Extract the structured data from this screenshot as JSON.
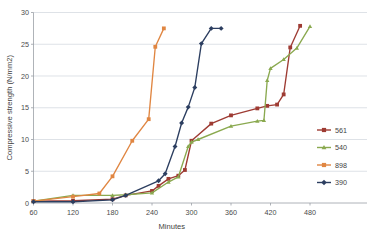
{
  "chart_data": {
    "type": "line",
    "title": "",
    "xlabel": "Minutes",
    "ylabel": "Compressive strength (N/mm2)",
    "xlim": [
      60,
      480
    ],
    "ylim": [
      0,
      30
    ],
    "xticks": [
      60,
      120,
      180,
      240,
      300,
      360,
      420,
      480
    ],
    "yticks": [
      0,
      5,
      10,
      15,
      20,
      25,
      30
    ],
    "grid": true,
    "legend_position": "right",
    "series": [
      {
        "name": "561",
        "color": "#9e3b33",
        "marker": "square",
        "x": [
          60,
          120,
          180,
          200,
          240,
          250,
          265,
          280,
          290,
          300,
          330,
          360,
          400,
          415,
          430,
          440,
          450,
          465
        ],
        "y": [
          0.3,
          0.35,
          0.6,
          1.2,
          1.9,
          2.7,
          3.8,
          4.3,
          5.2,
          9.8,
          12.5,
          13.8,
          14.9,
          15.3,
          15.5,
          17.1,
          24.5,
          27.9
        ]
      },
      {
        "name": "540",
        "color": "#8aa94f",
        "marker": "triangle",
        "x": [
          60,
          120,
          180,
          200,
          240,
          265,
          280,
          295,
          300,
          310,
          360,
          400,
          410,
          415,
          420,
          440,
          460,
          480
        ],
        "y": [
          0.3,
          1.2,
          1.2,
          1.3,
          1.6,
          3.3,
          4.1,
          8.9,
          9.6,
          10.0,
          12.1,
          12.9,
          13.0,
          19.3,
          21.2,
          22.6,
          24.4,
          27.8
        ]
      },
      {
        "name": "898",
        "color": "#e08642",
        "marker": "square",
        "x": [
          60,
          120,
          160,
          180,
          210,
          235,
          245,
          258
        ],
        "y": [
          0.3,
          1.0,
          1.5,
          4.2,
          9.8,
          13.2,
          24.6,
          27.5
        ]
      },
      {
        "name": "390",
        "color": "#2c3e60",
        "marker": "diamond",
        "x": [
          60,
          120,
          180,
          200,
          250,
          260,
          275,
          285,
          295,
          305,
          315,
          330,
          345
        ],
        "y": [
          0.2,
          0.2,
          0.5,
          1.2,
          3.5,
          4.6,
          8.9,
          12.6,
          15.1,
          18.2,
          25.1,
          27.5,
          27.5
        ]
      }
    ]
  },
  "legend": {
    "entries": [
      {
        "label": "561"
      },
      {
        "label": "540"
      },
      {
        "label": "898"
      },
      {
        "label": "390"
      }
    ]
  }
}
